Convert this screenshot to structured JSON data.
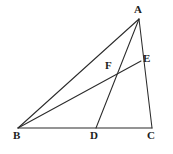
{
  "figure": {
    "kind": "euclidean-geometry-diagram",
    "width": 173,
    "height": 154,
    "background_color": "#ffffff",
    "line_color": "#2b2b2b",
    "label_color": "#1d1d1d",
    "points": [
      {
        "name": "A",
        "label": "A",
        "x": 139,
        "y": 19
      },
      {
        "name": "B",
        "label": "B",
        "x": 18,
        "y": 128
      },
      {
        "name": "C",
        "label": "C",
        "x": 152,
        "y": 128
      },
      {
        "name": "D",
        "label": "D",
        "x": 96,
        "y": 128
      },
      {
        "name": "E",
        "label": "E",
        "x": 141,
        "y": 61
      },
      {
        "name": "F",
        "label": "F",
        "x": 113,
        "y": 71
      }
    ],
    "segments": [
      {
        "name": "segment-BA",
        "from": "B",
        "to": "A",
        "x1": 18,
        "y1": 128,
        "x2": 139,
        "y2": 19
      },
      {
        "name": "segment-BC",
        "from": "B",
        "to": "C",
        "x1": 18,
        "y1": 128,
        "x2": 152,
        "y2": 128
      },
      {
        "name": "segment-AC",
        "from": "A",
        "to": "C",
        "x1": 139,
        "y1": 19,
        "x2": 152,
        "y2": 128
      },
      {
        "name": "segment-BE",
        "from": "B",
        "to": "E",
        "x1": 18,
        "y1": 128,
        "x2": 141,
        "y2": 61
      },
      {
        "name": "segment-AD",
        "from": "A",
        "to": "D",
        "x1": 139,
        "y1": 19,
        "x2": 96,
        "y2": 128
      }
    ]
  }
}
